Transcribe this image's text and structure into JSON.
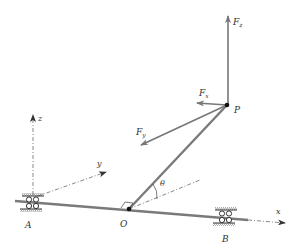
{
  "diagram": {
    "colors": {
      "member": "#7a7a7a",
      "force": "#777777",
      "axis": "#555555",
      "point": "#111111",
      "label": "#333333",
      "hatch": "#555555"
    },
    "labels": {
      "Fz": {
        "main": "F",
        "sub": "z"
      },
      "Fx": {
        "main": "F",
        "sub": "x"
      },
      "Fy": {
        "main": "F",
        "sub": "y"
      },
      "P": "P",
      "O": "O",
      "A": "A",
      "B": "B",
      "x": "x",
      "y": "y",
      "z": "z",
      "theta": "θ"
    },
    "points": {
      "P": [
        227,
        105
      ],
      "O": [
        129,
        209
      ],
      "A": [
        33,
        203
      ],
      "B": [
        226,
        217
      ]
    },
    "components": [
      "shaft-AB",
      "bearing-A",
      "bearing-B",
      "crank-arm-OP",
      "force-Fz",
      "force-Fx",
      "force-Fy",
      "axis-x",
      "axis-y",
      "axis-z",
      "angle-theta",
      "right-angle-marker-O"
    ]
  }
}
